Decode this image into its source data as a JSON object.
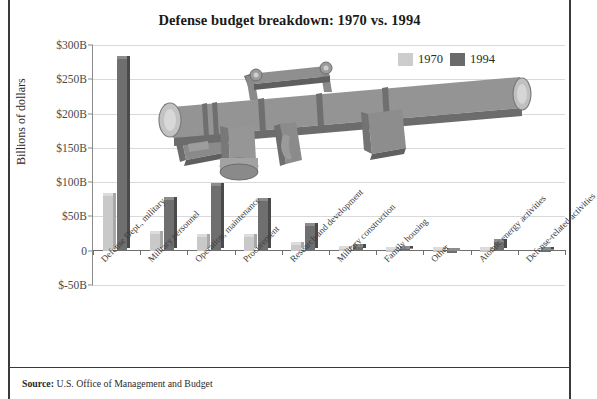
{
  "chart_data": {
    "type": "bar",
    "title": "Defense budget breakdown: 1970 vs. 1994",
    "xlabel": "",
    "ylabel": "Billions of dollars",
    "ylim": [
      -50,
      300
    ],
    "ytick_labels": [
      "$300B",
      "$250B",
      "$200B",
      "$150B",
      "$100B",
      "$50B",
      "0",
      "$-50B"
    ],
    "ytick_values": [
      300,
      250,
      200,
      150,
      100,
      50,
      0,
      -50
    ],
    "grid": true,
    "legend_position": "top-right",
    "categories": [
      "Defense Dept., military",
      "Military personnel",
      "Operation, maintenance",
      "Procurement",
      "Research and development",
      "Military construction",
      "Family housing",
      "Other",
      "Atomic energy activities",
      "Defense-related activities"
    ],
    "series": [
      {
        "name": "1970",
        "color": "#c9c9c9",
        "values": [
          80,
          24,
          20,
          20,
          8,
          2,
          1,
          1,
          1,
          0
        ]
      },
      {
        "name": "1994",
        "color": "#6f6f6f",
        "values": [
          280,
          74,
          95,
          72,
          36,
          5,
          3,
          -3,
          12,
          1
        ]
      }
    ]
  },
  "legend": {
    "items": [
      {
        "label": "1970",
        "swatch": "swatch-1970"
      },
      {
        "label": "1994",
        "swatch": "swatch-1994"
      }
    ]
  },
  "illustration": {
    "name": "bazooka-rocket-launcher",
    "body_color": "#8e8e8e",
    "shadow_color": "#6b6b6b",
    "highlight_color": "#b8b8b8"
  },
  "source": {
    "prefix": "Source:",
    "text": "U.S. Office of Management and Budget"
  }
}
